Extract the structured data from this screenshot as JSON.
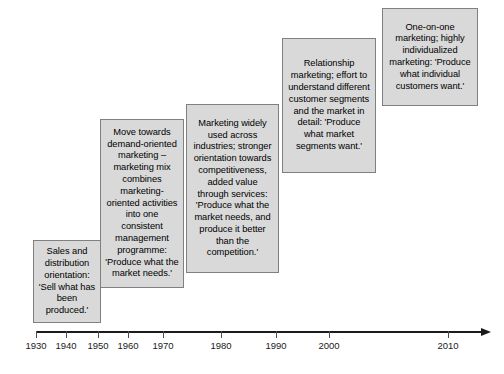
{
  "diagram": {
    "background_color": "#ffffff",
    "box_fill_color": "#d9d9d9",
    "box_border_color": "#808080",
    "axis_color": "#1a1a1a",
    "stages": [
      {
        "id": "sales-and-distribution-orientation",
        "text": "Sales and distribution orientation: 'Sell what has been produced.'",
        "x": 33,
        "y": 240,
        "width": 68,
        "height": 83
      },
      {
        "id": "demand-oriented-marketing",
        "text": "Move towards demand-oriented marketing – marketing mix combines marketing-oriented activities into one consistent management programme: 'Produce what the market needs.'",
        "x": 100,
        "y": 119,
        "width": 84,
        "height": 169
      },
      {
        "id": "marketing-widely-used",
        "text": "Marketing widely used across industries; stronger orientation towards competitiveness, added value through services: 'Produce what the market needs, and produce it better than the competition.'",
        "x": 186,
        "y": 104,
        "width": 93,
        "height": 169
      },
      {
        "id": "relationship-marketing",
        "text": "Relationship marketing; effort to understand different customer segments and the market in detail: 'Produce what market segments want.'",
        "x": 282,
        "y": 38,
        "width": 94,
        "height": 135
      },
      {
        "id": "one-on-one-marketing",
        "text": "One-on-one marketing; highly individualized marketing: 'Produce what individual customers want.'",
        "x": 382,
        "y": 8,
        "width": 96,
        "height": 98
      }
    ],
    "axis": {
      "start_x": 36,
      "end_x": 490,
      "y": 331,
      "ticks": [
        {
          "label": "1930",
          "x": 36
        },
        {
          "label": "1940",
          "x": 66
        },
        {
          "label": "1950",
          "x": 98
        },
        {
          "label": "1960",
          "x": 128
        },
        {
          "label": "1970",
          "x": 163
        },
        {
          "label": "1980",
          "x": 221
        },
        {
          "label": "1990",
          "x": 276
        },
        {
          "label": "2000",
          "x": 329
        },
        {
          "label": "2010",
          "x": 448
        }
      ]
    }
  }
}
